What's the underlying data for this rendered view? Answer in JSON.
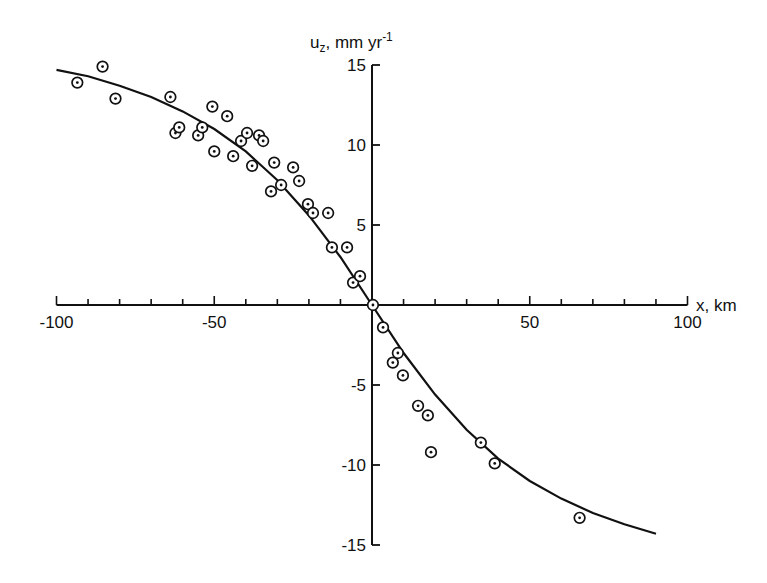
{
  "chart_data": {
    "type": "scatter",
    "title": "",
    "xlabel": "x, km",
    "ylabel": "u_z, mm yr^-1",
    "ylabel_parts": {
      "main": "u",
      "sub": "z",
      "rest": ", mm yr",
      "sup": "-1"
    },
    "xlim": [
      -100,
      100
    ],
    "ylim": [
      -15,
      15
    ],
    "x_ticks_major": [
      -100,
      -50,
      50,
      100
    ],
    "x_tick_labels": [
      "-100",
      "-50",
      "50",
      "100"
    ],
    "x_ticks_minor_step": 10,
    "y_ticks_major": [
      15,
      10,
      5,
      -5,
      -10,
      -15
    ],
    "y_tick_labels": [
      "15",
      "10",
      "5",
      "-5",
      "-10",
      "-15"
    ],
    "grid": false,
    "legend": null,
    "series": [
      {
        "name": "observations",
        "marker": "circled-dot",
        "points": [
          [
            -93.4,
            13.9
          ],
          [
            -85.4,
            14.9
          ],
          [
            -81.3,
            12.9
          ],
          [
            -63.9,
            13.0
          ],
          [
            -62.3,
            10.75
          ],
          [
            -61.1,
            11.1
          ],
          [
            -55.1,
            10.6
          ],
          [
            -53.8,
            11.1
          ],
          [
            -50.6,
            12.4
          ],
          [
            -50.0,
            9.6
          ],
          [
            -45.9,
            11.8
          ],
          [
            -44.0,
            9.3
          ],
          [
            -41.5,
            10.25
          ],
          [
            -39.6,
            10.75
          ],
          [
            -38.0,
            8.7
          ],
          [
            -35.8,
            10.6
          ],
          [
            -34.5,
            10.25
          ],
          [
            -32.0,
            7.1
          ],
          [
            -31.0,
            8.9
          ],
          [
            -28.8,
            7.5
          ],
          [
            -25.0,
            8.6
          ],
          [
            -23.1,
            7.75
          ],
          [
            -20.3,
            6.3
          ],
          [
            -18.7,
            5.75
          ],
          [
            -13.9,
            5.75
          ],
          [
            -12.7,
            3.6
          ],
          [
            -7.9,
            3.6
          ],
          [
            -6.0,
            1.4
          ],
          [
            -3.8,
            1.8
          ],
          [
            0.3,
            0.0
          ],
          [
            3.5,
            -1.4
          ],
          [
            8.2,
            -3.0
          ],
          [
            6.6,
            -3.6
          ],
          [
            9.8,
            -4.4
          ],
          [
            14.6,
            -6.3
          ],
          [
            17.7,
            -6.9
          ],
          [
            18.7,
            -9.2
          ],
          [
            34.5,
            -8.6
          ],
          [
            38.9,
            -9.9
          ],
          [
            65.8,
            -13.3
          ]
        ]
      },
      {
        "name": "model fit",
        "marker": "line",
        "points": [
          [
            -100,
            14.7
          ],
          [
            -90,
            14.3
          ],
          [
            -80,
            13.7
          ],
          [
            -70,
            13.0
          ],
          [
            -60,
            12.1
          ],
          [
            -50,
            11.0
          ],
          [
            -40,
            9.6
          ],
          [
            -30,
            7.8
          ],
          [
            -20,
            5.6
          ],
          [
            -10,
            3.0
          ],
          [
            0,
            0.0
          ],
          [
            10,
            -3.0
          ],
          [
            20,
            -5.6
          ],
          [
            30,
            -7.8
          ],
          [
            40,
            -9.6
          ],
          [
            50,
            -11.0
          ],
          [
            60,
            -12.1
          ],
          [
            70,
            -13.0
          ],
          [
            80,
            -13.7
          ],
          [
            90,
            -14.3
          ]
        ]
      }
    ]
  },
  "axes": {
    "x_label": "x, km",
    "y_label": {
      "main": "u",
      "sub": "z",
      "rest": ", mm yr",
      "sup": "-1"
    }
  }
}
